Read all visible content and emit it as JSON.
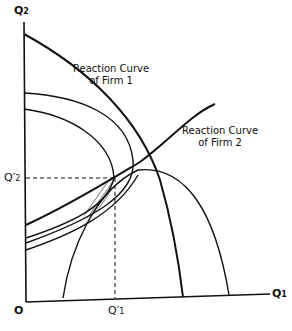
{
  "diagram": {
    "type": "duopoly-reaction-curves",
    "axes": {
      "y_label": "Q",
      "y_sub": "2",
      "x_label": "Q",
      "x_sub": "1",
      "origin_label": "O"
    },
    "markers": {
      "q2_prime_label": "Q",
      "q2_prime_sub": "2",
      "q2_prime_mark": "′",
      "q1_prime_label": "Q",
      "q1_prime_sub": "1",
      "q1_prime_mark": "′"
    },
    "curves": {
      "firm1": {
        "line1": "Reaction Curve",
        "line2": "of Firm 1"
      },
      "firm2": {
        "line1": "Reaction Curve",
        "line2": "of Firm 2"
      }
    },
    "colors": {
      "ink": "#111111",
      "background": "#ffffff"
    }
  }
}
